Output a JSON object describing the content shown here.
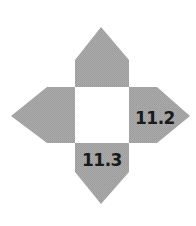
{
  "diagram": {
    "type": "cross-net",
    "colors": {
      "arm_fill": "#a6a6a6",
      "center_fill": "#ffffff",
      "label_color": "#1a1a1a"
    },
    "center_square": {
      "x": 75,
      "y": 87,
      "width": 54,
      "height": 56
    },
    "arms": [
      {
        "name": "top",
        "label": ""
      },
      {
        "name": "left",
        "label": ""
      },
      {
        "name": "right",
        "label": "11.2"
      },
      {
        "name": "bottom",
        "label": "11.3"
      }
    ]
  }
}
